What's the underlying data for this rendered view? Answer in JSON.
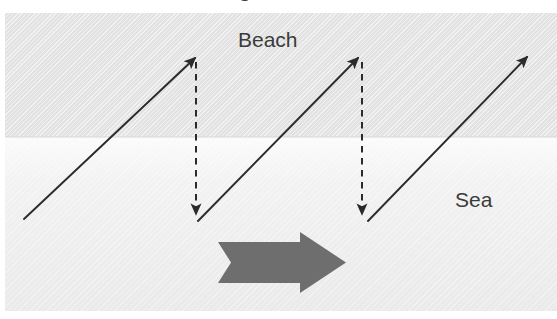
{
  "figure": {
    "title_fragment": "Longshore drift",
    "width": 557,
    "height": 319
  },
  "labels": {
    "beach": "Beach",
    "sea": "Sea"
  },
  "colors": {
    "beach_band": "#e2e2e2",
    "sea_band": "#f0f0f0",
    "arrow_stroke": "#2b2b2b",
    "drift_arrow_fill": "#6e6e6e",
    "label_text": "#3b3b3b",
    "page_background": "#ffffff"
  },
  "diagram_data": {
    "type": "diagram",
    "subject": "longshore-drift",
    "bands": [
      {
        "name": "beach",
        "label": "Beach",
        "top": 13,
        "height": 124,
        "fill": "#e2e2e2",
        "hatched": true
      },
      {
        "name": "sea",
        "label": "Sea",
        "top": 137,
        "height": 174,
        "fill": "#f0f0f0",
        "hatched": true
      }
    ],
    "swash_arrows": [
      {
        "name": "swash-1",
        "x1": 24,
        "y1": 219,
        "x2": 195,
        "y2": 58,
        "style": "solid",
        "direction": "up-right"
      },
      {
        "name": "swash-2",
        "x1": 198,
        "y1": 221,
        "x2": 358,
        "y2": 58,
        "style": "solid",
        "direction": "up-right"
      },
      {
        "name": "swash-3",
        "x1": 368,
        "y1": 221,
        "x2": 527,
        "y2": 57,
        "style": "solid",
        "direction": "up-right"
      }
    ],
    "backwash_arrows": [
      {
        "name": "backwash-1",
        "x1": 196,
        "y1": 62,
        "x2": 196,
        "y2": 214,
        "style": "dashed",
        "direction": "down"
      },
      {
        "name": "backwash-2",
        "x1": 362,
        "y1": 62,
        "x2": 362,
        "y2": 214,
        "style": "dashed",
        "direction": "down"
      }
    ],
    "drift_arrow": {
      "name": "net-drift-arrow",
      "x": 218,
      "y": 242,
      "width": 128,
      "height": 41,
      "direction": "right",
      "fill": "#6e6e6e"
    }
  }
}
